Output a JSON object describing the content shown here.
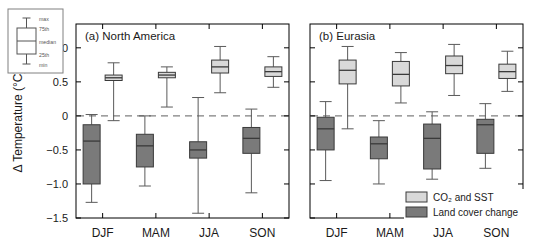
{
  "figure": {
    "axis_label_y": "Δ Temperature (°C)",
    "key_legend": {
      "name": "boxplot-key",
      "labels": [
        "max",
        "75th",
        "median",
        "25th",
        "min"
      ]
    },
    "series_legend": {
      "position": "bottom-right of panel b",
      "entries": [
        {
          "label": "CO₂ and SST",
          "color": "#d9d9d9",
          "key": "co2_sst"
        },
        {
          "label": "Land cover change",
          "color": "#7a7a7a",
          "key": "land_cover"
        }
      ]
    },
    "colors": {
      "light_fill": "#d9d9d9",
      "dark_fill": "#7a7a7a",
      "outline": "#3a3a3a",
      "whisker": "#5a5a5a",
      "axis": "#000000",
      "zero_line": "#808080"
    }
  },
  "chart_data": [
    {
      "type": "box",
      "title": "(a) North America",
      "panel": "a",
      "xlabel": "",
      "ylabel": "Δ Temperature (°C)",
      "ylim": [
        -1.5,
        1.35
      ],
      "yticks": [
        1.0,
        0.5,
        0,
        -0.5,
        -1.0,
        -1.5
      ],
      "ytick_labels": [
        "1.0",
        "0.5",
        "0",
        "−0.5",
        "−1.0",
        "−1.5"
      ],
      "categories": [
        "DJF",
        "MAM",
        "JJA",
        "SON"
      ],
      "grid": false,
      "zero_reference_line": 0,
      "series": [
        {
          "name": "CO₂ and SST",
          "color": "#d9d9d9",
          "boxes": [
            {
              "category": "DJF",
              "min": -0.07,
              "q1": 0.52,
              "median": 0.56,
              "q3": 0.6,
              "max": 0.78
            },
            {
              "category": "MAM",
              "min": 0.13,
              "q1": 0.56,
              "median": 0.6,
              "q3": 0.64,
              "max": 0.72
            },
            {
              "category": "JJA",
              "min": 0.34,
              "q1": 0.63,
              "median": 0.72,
              "q3": 0.82,
              "max": 1.02
            },
            {
              "category": "SON",
              "min": 0.42,
              "q1": 0.58,
              "median": 0.65,
              "q3": 0.72,
              "max": 0.87
            }
          ]
        },
        {
          "name": "Land cover change",
          "color": "#7a7a7a",
          "boxes": [
            {
              "category": "DJF",
              "min": -1.27,
              "q1": -1.0,
              "median": -0.37,
              "q3": -0.13,
              "max": 0.02
            },
            {
              "category": "MAM",
              "min": -1.03,
              "q1": -0.75,
              "median": -0.44,
              "q3": -0.27,
              "max": 0.0
            },
            {
              "category": "JJA",
              "min": -1.43,
              "q1": -0.62,
              "median": -0.5,
              "q3": -0.38,
              "max": 0.27
            },
            {
              "category": "SON",
              "min": -1.13,
              "q1": -0.55,
              "median": -0.33,
              "q3": -0.17,
              "max": 0.1
            }
          ]
        }
      ]
    },
    {
      "type": "box",
      "title": "(b) Eurasia",
      "panel": "b",
      "xlabel": "",
      "ylabel": "",
      "ylim": [
        -1.5,
        1.35
      ],
      "yticks": [
        1.0,
        0.5,
        0,
        -0.5,
        -1.0,
        -1.5
      ],
      "ytick_labels": [
        "1.0",
        "0.5",
        "0",
        "−0.5",
        "−1.0",
        "−1.5"
      ],
      "categories": [
        "DJF",
        "MAM",
        "JJA",
        "SON"
      ],
      "grid": false,
      "zero_reference_line": 0,
      "series": [
        {
          "name": "CO₂ and SST",
          "color": "#d9d9d9",
          "boxes": [
            {
              "category": "DJF",
              "min": -0.19,
              "q1": 0.47,
              "median": 0.67,
              "q3": 0.82,
              "max": 1.02
            },
            {
              "category": "MAM",
              "min": 0.19,
              "q1": 0.44,
              "median": 0.61,
              "q3": 0.8,
              "max": 0.93
            },
            {
              "category": "JJA",
              "min": 0.3,
              "q1": 0.62,
              "median": 0.74,
              "q3": 0.88,
              "max": 1.05
            },
            {
              "category": "SON",
              "min": 0.36,
              "q1": 0.55,
              "median": 0.65,
              "q3": 0.76,
              "max": 0.95
            }
          ]
        },
        {
          "name": "Land cover change",
          "color": "#7a7a7a",
          "boxes": [
            {
              "category": "DJF",
              "min": -0.95,
              "q1": -0.5,
              "median": -0.19,
              "q3": -0.02,
              "max": 0.21
            },
            {
              "category": "MAM",
              "min": -1.0,
              "q1": -0.63,
              "median": -0.41,
              "q3": -0.31,
              "max": -0.07
            },
            {
              "category": "JJA",
              "min": -0.93,
              "q1": -0.78,
              "median": -0.33,
              "q3": -0.12,
              "max": 0.06
            },
            {
              "category": "SON",
              "min": -0.77,
              "q1": -0.55,
              "median": -0.13,
              "q3": -0.05,
              "max": 0.18
            }
          ]
        }
      ]
    }
  ]
}
